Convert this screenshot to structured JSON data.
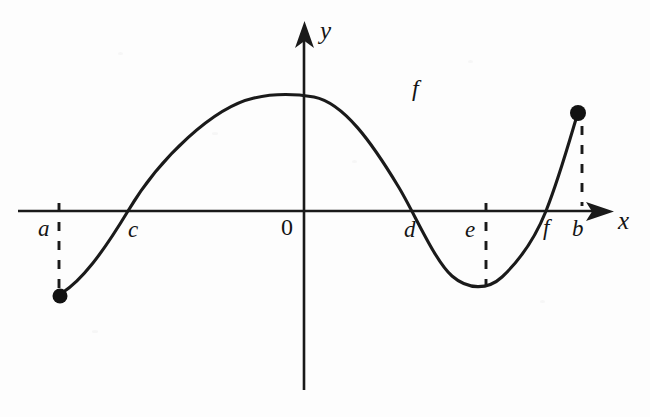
{
  "figure": {
    "background_color": "#fdfdfd",
    "ink_color": "#1a1a1a"
  },
  "axes": {
    "x_label": "x",
    "y_label": "y",
    "origin_label": "0",
    "x_axis": {
      "y_px": 211,
      "start_px": 18,
      "end_px": 612
    },
    "y_axis": {
      "x_px": 304,
      "top_px": 22,
      "bottom_px": 390
    }
  },
  "point_labels": [
    {
      "id": "a",
      "text": "a",
      "x_px": 38,
      "y_px": 217
    },
    {
      "id": "c",
      "text": "c",
      "x_px": 128,
      "y_px": 218
    },
    {
      "id": "d",
      "text": "d",
      "x_px": 404,
      "y_px": 218
    },
    {
      "id": "e",
      "text": "e",
      "x_px": 465,
      "y_px": 218
    },
    {
      "id": "f",
      "text": "f",
      "x_px": 543,
      "y_px": 218
    },
    {
      "id": "b",
      "text": "b",
      "x_px": 572,
      "y_px": 217
    }
  ],
  "curve_label": {
    "text": "f",
    "x_px": 412,
    "y_px": 76
  },
  "chart_data": {
    "type": "line",
    "xlabel": "x",
    "ylabel": "y",
    "grid": false,
    "legend": null,
    "annotations": [
      "f",
      "a",
      "c",
      "0",
      "d",
      "e",
      "f",
      "b",
      "x",
      "y"
    ],
    "x_marks": [
      {
        "name": "a",
        "role": "left-endpoint-of-domain",
        "x_px": 59
      },
      {
        "name": "c",
        "role": "x-intercept-rising",
        "x_px": 128
      },
      {
        "name": "0",
        "role": "origin",
        "x_px": 304
      },
      {
        "name": "d",
        "role": "x-intercept-falling",
        "x_px": 418
      },
      {
        "name": "e",
        "role": "local-minimum-abscissa",
        "x_px": 486
      },
      {
        "name": "f",
        "role": "x-intercept-rising",
        "x_px": 545
      },
      {
        "name": "b",
        "role": "right-endpoint-of-domain",
        "x_px": 580
      }
    ],
    "key_points": [
      {
        "label": "left endpoint (a, f(a))",
        "x_px": 59,
        "y_px": 296,
        "marker": "filled-dot",
        "below_axis": true
      },
      {
        "label": "zero at c",
        "x_px": 128,
        "y_px": 211,
        "marker": "none",
        "below_axis": false
      },
      {
        "label": "local maximum",
        "x_px": 311,
        "y_px": 95,
        "marker": "none",
        "below_axis": false
      },
      {
        "label": "zero at d",
        "x_px": 418,
        "y_px": 211,
        "marker": "none",
        "below_axis": false
      },
      {
        "label": "local minimum at e",
        "x_px": 486,
        "y_px": 289,
        "marker": "none",
        "below_axis": true
      },
      {
        "label": "zero at f",
        "x_px": 545,
        "y_px": 211,
        "marker": "none",
        "below_axis": false
      },
      {
        "label": "right endpoint (b, f(b))",
        "x_px": 578,
        "y_px": 113,
        "marker": "filled-dot",
        "below_axis": false
      }
    ],
    "curve_path": "M 62,293 C 84,278 104,252 128,211 C 168,143 232,98 270,96 C 292,95 302,95 312,96 C 340,98 370,140 400,188 C 418,217 436,262 452,277 C 468,291 486,290 500,278 C 518,262 534,236 545,211 C 558,182 568,146 576,118",
    "dashed_drops": [
      {
        "name": "a-drop",
        "x_px": 59,
        "from_y_px": 205,
        "to_y_px": 289,
        "side": "below-axis"
      },
      {
        "name": "e-drop",
        "x_px": 486,
        "from_y_px": 205,
        "to_y_px": 285,
        "side": "below-axis"
      },
      {
        "name": "b-drop",
        "x_px": 582,
        "from_y_px": 126,
        "to_y_px": 205,
        "side": "above-axis"
      }
    ]
  }
}
